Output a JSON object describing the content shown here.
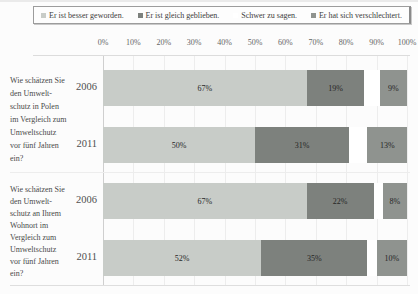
{
  "figure": {
    "background": "#fcfcfc"
  },
  "legend": {
    "items": [
      {
        "label": "Er ist besser geworden.",
        "color": "#c8ccc8"
      },
      {
        "label": "Er ist gleich geblieben.",
        "color": "#7d817d"
      },
      {
        "label": "Schwer zu sagen.",
        "color": "#ffffff"
      },
      {
        "label": "Er hat sich verschlechtert.",
        "color": "#8f938f"
      }
    ]
  },
  "chart_data": {
    "type": "bar",
    "orientation": "horizontal",
    "stacked": true,
    "unit": "%",
    "x_range": [
      0,
      100
    ],
    "x_ticks": [
      "0%",
      "10%",
      "20%",
      "30%",
      "40%",
      "50%",
      "60%",
      "70%",
      "80%",
      "90%",
      "100%"
    ],
    "grid": true,
    "legend_position": "top",
    "series_names": [
      "Er ist besser geworden.",
      "Er ist gleich geblieben.",
      "Schwer zu sagen.",
      "Er hat sich verschlechtert."
    ],
    "series_colors": [
      "#c8ccc8",
      "#7d817d",
      "#ffffff",
      "#8f938f"
    ],
    "groups": [
      {
        "question": "Wie schätzen Sie\nden Umwelt-\nschutz in Polen\nim Vergleich zum\nUmweltschutz\nvor fünf Jahren\nein?",
        "rows": [
          {
            "year": "2006",
            "values": [
              67,
              19,
              5,
              9
            ],
            "labels": [
              "67%",
              "19%",
              "",
              "9%"
            ]
          },
          {
            "year": "2011",
            "values": [
              50,
              31,
              6,
              13
            ],
            "labels": [
              "50%",
              "31%",
              "",
              "13%"
            ]
          }
        ]
      },
      {
        "question": "Wie schätzen Sie\nden Umwelt-\nschutz an Ihrem\nWohnort im\nVergleich zum\nUmweltschutz\nvor fünf Jahren\nein?",
        "rows": [
          {
            "year": "2006",
            "values": [
              67,
              22,
              3,
              8
            ],
            "labels": [
              "67%",
              "22%",
              "",
              "8%"
            ]
          },
          {
            "year": "2011",
            "values": [
              52,
              35,
              3,
              10
            ],
            "labels": [
              "52%",
              "35%",
              "",
              "10%"
            ]
          }
        ]
      }
    ]
  }
}
